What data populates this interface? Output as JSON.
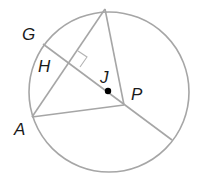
{
  "diagram": {
    "type": "circle-geometry",
    "colors": {
      "stroke": "#a6a6a6",
      "label": "#1a1a1a",
      "point": "#000000",
      "background": "#ffffff"
    },
    "circle": {
      "cx": 109,
      "cy": 92,
      "r": 80
    },
    "points": {
      "top": {
        "x": 105,
        "y": 9,
        "label": ""
      },
      "G": {
        "x": 43,
        "y": 44,
        "label": "G"
      },
      "H": {
        "x": 69,
        "y": 62,
        "label": "H"
      },
      "A": {
        "x": 32,
        "y": 117,
        "label": "A"
      },
      "J": {
        "x": 108,
        "y": 91,
        "label": "J"
      },
      "P": {
        "x": 124,
        "y": 105,
        "label": "P"
      },
      "E": {
        "x": 172,
        "y": 140,
        "label": ""
      }
    },
    "segments": [
      {
        "from": "G",
        "to": "E",
        "name": "diameter-line-through-H-J-P"
      },
      {
        "from": "A",
        "to": "top",
        "name": "chord"
      },
      {
        "from": "top",
        "to": "P",
        "name": "radius-top"
      },
      {
        "from": "A",
        "to": "P",
        "name": "radius-A"
      }
    ],
    "annotations": {
      "right_angle_at": "H"
    },
    "labels": {
      "G": "G",
      "H": "H",
      "J": "J",
      "P": "P",
      "A": "A"
    }
  }
}
